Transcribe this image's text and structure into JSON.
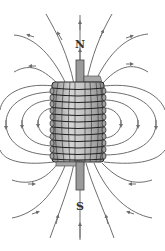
{
  "diagram": {
    "labels": {
      "north": "N",
      "south": "S"
    },
    "colors": {
      "field_line": "#6e6e6e",
      "coil_fill": "#b8b8b8",
      "coil_wire": "#2a2a2a",
      "core_fill": "#9a9a9a",
      "background": "#ffffff"
    },
    "coil": {
      "turns": 12
    }
  }
}
